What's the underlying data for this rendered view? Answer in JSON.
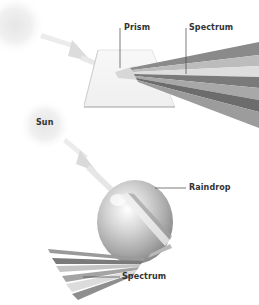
{
  "diagram": {
    "type": "light-dispersion-comparison",
    "panels": [
      {
        "name": "prism-dispersion",
        "labels": {
          "prism": "Prism",
          "spectrum": "Spectrum"
        }
      },
      {
        "name": "raindrop-dispersion",
        "labels": {
          "sun": "Sun",
          "raindrop": "Raindrop",
          "spectrum": "Spectrum"
        }
      }
    ]
  },
  "labels": {
    "prism": "Prism",
    "spectrum_top": "Spectrum",
    "sun": "Sun",
    "raindrop": "Raindrop",
    "spectrum_bottom": "Spectrum"
  },
  "colors": {
    "background": "#ffffff",
    "text": "#333333",
    "leader_line": "#444444",
    "band_dark": "#6e6e6e",
    "band_mid": "#9a9a9a",
    "band_light": "#c4c4c4",
    "band_pale": "#e0e0e0"
  }
}
